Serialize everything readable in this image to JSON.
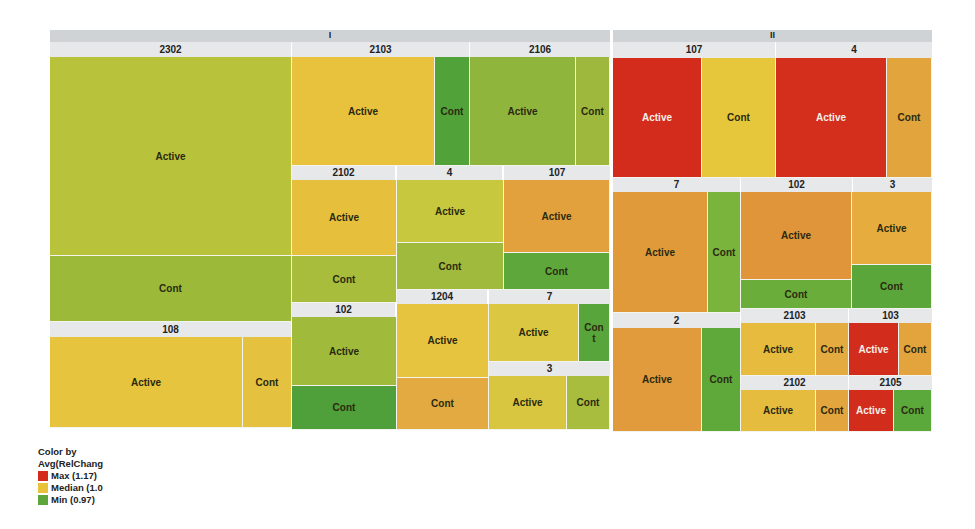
{
  "chart_data": {
    "type": "treemap",
    "title": "",
    "color_by": "Avg(RelChang",
    "colors": {
      "max": "#d42a1c",
      "median": "#e9c23a",
      "min": "#5ca63b"
    },
    "legend": [
      {
        "label": "Max (1.17)",
        "color": "#d42a1c"
      },
      {
        "label": "Median (1.0",
        "color": "#e9c23a"
      },
      {
        "label": "Min (0.97)",
        "color": "#5ca63b"
      }
    ],
    "groups": [
      {
        "name": "I",
        "x": 50,
        "y": 30,
        "w": 560,
        "h": 12
      },
      {
        "name": "II",
        "x": 613,
        "y": 30,
        "w": 319,
        "h": 12
      }
    ],
    "subgroups": [
      {
        "group": "I",
        "name": "2302",
        "x": 50,
        "y": 42,
        "w": 241,
        "h": 15
      },
      {
        "group": "I",
        "name": "108",
        "x": 50,
        "y": 322,
        "w": 241,
        "h": 15
      },
      {
        "group": "I",
        "name": "2103",
        "x": 292,
        "y": 42,
        "w": 177,
        "h": 15
      },
      {
        "group": "I",
        "name": "2106",
        "x": 470,
        "y": 42,
        "w": 140,
        "h": 15
      },
      {
        "group": "I",
        "name": "2102",
        "x": 292,
        "y": 166,
        "w": 103,
        "h": 14
      },
      {
        "group": "I",
        "name": "4",
        "x": 397,
        "y": 166,
        "w": 105,
        "h": 14
      },
      {
        "group": "I",
        "name": "107",
        "x": 504,
        "y": 166,
        "w": 106,
        "h": 14
      },
      {
        "group": "I",
        "name": "102",
        "x": 292,
        "y": 303,
        "w": 103,
        "h": 14
      },
      {
        "group": "I",
        "name": "1204",
        "x": 397,
        "y": 290,
        "w": 90,
        "h": 14
      },
      {
        "group": "I",
        "name": "7",
        "x": 489,
        "y": 290,
        "w": 121,
        "h": 14
      },
      {
        "group": "I",
        "name": "3",
        "x": 489,
        "y": 362,
        "w": 121,
        "h": 14
      },
      {
        "group": "II",
        "name": "107",
        "x": 613,
        "y": 42,
        "w": 162,
        "h": 16
      },
      {
        "group": "II",
        "name": "4",
        "x": 776,
        "y": 42,
        "w": 156,
        "h": 16
      },
      {
        "group": "II",
        "name": "7",
        "x": 613,
        "y": 178,
        "w": 127,
        "h": 14
      },
      {
        "group": "II",
        "name": "102",
        "x": 741,
        "y": 178,
        "w": 111,
        "h": 14
      },
      {
        "group": "II",
        "name": "3",
        "x": 853,
        "y": 178,
        "w": 79,
        "h": 14
      },
      {
        "group": "II",
        "name": "2",
        "x": 613,
        "y": 313,
        "w": 127,
        "h": 15
      },
      {
        "group": "II",
        "name": "2103",
        "x": 741,
        "y": 309,
        "w": 107,
        "h": 14
      },
      {
        "group": "II",
        "name": "103",
        "x": 849,
        "y": 309,
        "w": 83,
        "h": 14
      },
      {
        "group": "II",
        "name": "2102",
        "x": 741,
        "y": 376,
        "w": 107,
        "h": 14
      },
      {
        "group": "II",
        "name": "2105",
        "x": 849,
        "y": 376,
        "w": 83,
        "h": 14
      }
    ],
    "cells": [
      {
        "parent": "I/2302",
        "label": "Active",
        "x": 50,
        "y": 57,
        "w": 242,
        "h": 199,
        "color": "#b8c23a"
      },
      {
        "parent": "I/2302",
        "label": "Cont",
        "x": 50,
        "y": 256,
        "w": 242,
        "h": 66,
        "color": "#9cb93a"
      },
      {
        "parent": "I/108",
        "label": "Active",
        "x": 50,
        "y": 337,
        "w": 193,
        "h": 91,
        "color": "#e6c43e"
      },
      {
        "parent": "I/108",
        "label": "Cont",
        "x": 243,
        "y": 337,
        "w": 49,
        "h": 91,
        "color": "#e4c240"
      },
      {
        "parent": "I/2103",
        "label": "Active",
        "x": 292,
        "y": 57,
        "w": 143,
        "h": 109,
        "color": "#e9c23d"
      },
      {
        "parent": "I/2103",
        "label": "Cont",
        "x": 435,
        "y": 57,
        "w": 35,
        "h": 109,
        "color": "#52a23a"
      },
      {
        "parent": "I/2106",
        "label": "Active",
        "x": 470,
        "y": 57,
        "w": 106,
        "h": 109,
        "color": "#8fb53c"
      },
      {
        "parent": "I/2106",
        "label": "Cont",
        "x": 576,
        "y": 57,
        "w": 34,
        "h": 109,
        "color": "#9db83c"
      },
      {
        "parent": "I/2102",
        "label": "Active",
        "x": 292,
        "y": 180,
        "w": 105,
        "h": 76,
        "color": "#e6c03c"
      },
      {
        "parent": "I/2102",
        "label": "Cont",
        "x": 292,
        "y": 256,
        "w": 105,
        "h": 47,
        "color": "#a8bd3c"
      },
      {
        "parent": "I/4",
        "label": "Active",
        "x": 397,
        "y": 180,
        "w": 107,
        "h": 63,
        "color": "#c7c83e"
      },
      {
        "parent": "I/4",
        "label": "Cont",
        "x": 397,
        "y": 243,
        "w": 107,
        "h": 47,
        "color": "#9fba3c"
      },
      {
        "parent": "I/107",
        "label": "Active",
        "x": 504,
        "y": 180,
        "w": 106,
        "h": 73,
        "color": "#e3a13e"
      },
      {
        "parent": "I/107",
        "label": "Cont",
        "x": 504,
        "y": 253,
        "w": 106,
        "h": 37,
        "color": "#5ea83b"
      },
      {
        "parent": "I/102",
        "label": "Active",
        "x": 292,
        "y": 317,
        "w": 105,
        "h": 69,
        "color": "#a0bb3b"
      },
      {
        "parent": "I/102",
        "label": "Cont",
        "x": 292,
        "y": 386,
        "w": 105,
        "h": 44,
        "color": "#4f9f3a"
      },
      {
        "parent": "I/1204",
        "label": "Active",
        "x": 397,
        "y": 304,
        "w": 92,
        "h": 74,
        "color": "#e6c440"
      },
      {
        "parent": "I/1204",
        "label": "Cont",
        "x": 397,
        "y": 378,
        "w": 92,
        "h": 52,
        "color": "#e2aa40"
      },
      {
        "parent": "I/7",
        "label": "Active",
        "x": 489,
        "y": 304,
        "w": 90,
        "h": 58,
        "color": "#dcc742"
      },
      {
        "parent": "I/7",
        "label": "Con t",
        "x": 579,
        "y": 304,
        "w": 31,
        "h": 58,
        "color": "#58a53b"
      },
      {
        "parent": "I/3",
        "label": "Active",
        "x": 489,
        "y": 376,
        "w": 78,
        "h": 54,
        "color": "#d8c540"
      },
      {
        "parent": "I/3",
        "label": "Cont",
        "x": 567,
        "y": 376,
        "w": 43,
        "h": 54,
        "color": "#a8bd3e"
      },
      {
        "parent": "II/107",
        "label": "Active",
        "x": 613,
        "y": 58,
        "w": 89,
        "h": 120,
        "color": "#d42c1c",
        "light": true
      },
      {
        "parent": "II/107",
        "label": "Cont",
        "x": 702,
        "y": 58,
        "w": 74,
        "h": 120,
        "color": "#e6c73c"
      },
      {
        "parent": "II/4",
        "label": "Active",
        "x": 776,
        "y": 58,
        "w": 111,
        "h": 120,
        "color": "#d42e1c",
        "light": true
      },
      {
        "parent": "II/4",
        "label": "Cont",
        "x": 887,
        "y": 58,
        "w": 45,
        "h": 120,
        "color": "#e2a43c"
      },
      {
        "parent": "II/7",
        "label": "Active",
        "x": 613,
        "y": 192,
        "w": 95,
        "h": 121,
        "color": "#e19a3a"
      },
      {
        "parent": "II/7",
        "label": "Cont",
        "x": 708,
        "y": 192,
        "w": 33,
        "h": 121,
        "color": "#7ab43d"
      },
      {
        "parent": "II/102",
        "label": "Active",
        "x": 741,
        "y": 192,
        "w": 111,
        "h": 88,
        "color": "#e1953a"
      },
      {
        "parent": "II/102",
        "label": "Cont",
        "x": 741,
        "y": 280,
        "w": 111,
        "h": 29,
        "color": "#6aad3b"
      },
      {
        "parent": "II/3",
        "label": "Active",
        "x": 852,
        "y": 192,
        "w": 80,
        "h": 73,
        "color": "#e6ad3e"
      },
      {
        "parent": "II/3",
        "label": "Cont",
        "x": 852,
        "y": 265,
        "w": 80,
        "h": 44,
        "color": "#5aa63a"
      },
      {
        "parent": "II/2",
        "label": "Active",
        "x": 613,
        "y": 328,
        "w": 89,
        "h": 104,
        "color": "#e19a3c"
      },
      {
        "parent": "II/2",
        "label": "Cont",
        "x": 702,
        "y": 328,
        "w": 39,
        "h": 104,
        "color": "#5fa93b"
      },
      {
        "parent": "II/2103",
        "label": "Active",
        "x": 741,
        "y": 323,
        "w": 75,
        "h": 53,
        "color": "#e6bb3e"
      },
      {
        "parent": "II/2103",
        "label": "Cont",
        "x": 816,
        "y": 323,
        "w": 33,
        "h": 53,
        "color": "#e4ab40"
      },
      {
        "parent": "II/103",
        "label": "Active",
        "x": 849,
        "y": 323,
        "w": 50,
        "h": 53,
        "color": "#d22c1c",
        "light": true
      },
      {
        "parent": "II/103",
        "label": "Cont",
        "x": 899,
        "y": 323,
        "w": 33,
        "h": 53,
        "color": "#e3a43e"
      },
      {
        "parent": "II/2102",
        "label": "Active",
        "x": 741,
        "y": 390,
        "w": 75,
        "h": 42,
        "color": "#e6bc3e"
      },
      {
        "parent": "II/2102",
        "label": "Cont",
        "x": 816,
        "y": 390,
        "w": 33,
        "h": 42,
        "color": "#e3a63e"
      },
      {
        "parent": "II/2105",
        "label": "Active",
        "x": 849,
        "y": 390,
        "w": 45,
        "h": 42,
        "color": "#d22c1c",
        "light": true
      },
      {
        "parent": "II/2105",
        "label": "Cont",
        "x": 894,
        "y": 390,
        "w": 38,
        "h": 42,
        "color": "#5ba83b"
      }
    ]
  },
  "legend": {
    "title_line1": "Color by",
    "title_line2": "Avg(RelChang",
    "items": [
      {
        "label": "Max (1.17)",
        "color": "#d42a1c"
      },
      {
        "label": "Median (1.0",
        "color": "#e9c23a"
      },
      {
        "label": "Min (0.97)",
        "color": "#5ca63b"
      }
    ]
  }
}
